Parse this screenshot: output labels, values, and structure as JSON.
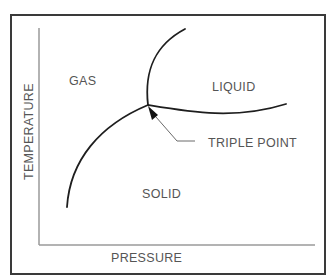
{
  "diagram": {
    "axes": {
      "x_label": "PRESSURE",
      "y_label": "TEMPERATURE"
    },
    "regions": {
      "gas": "GAS",
      "liquid": "LIQUID",
      "solid": "SOLID"
    },
    "annotations": {
      "triple_point": "TRIPLE POINT"
    },
    "colors": {
      "frame": "#3a3a3a",
      "curve": "#1e1e1e",
      "axis": "#9a9a9a",
      "text": "#555555"
    }
  }
}
